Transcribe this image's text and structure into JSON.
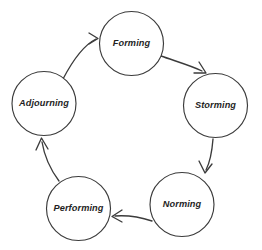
{
  "diagram": {
    "type": "cycle-diagram",
    "title": "",
    "background_color": "#ffffff",
    "stroke_color": "#3b3b3b",
    "label_color": "#1f1f1f",
    "stages": [
      {
        "id": "forming",
        "label": "Forming",
        "cx": 131.5,
        "cy": 43.5,
        "r": 32
      },
      {
        "id": "storming",
        "label": "Storming",
        "cx": 215.5,
        "cy": 105.5,
        "r": 32
      },
      {
        "id": "norming",
        "label": "Norming",
        "cx": 182.0,
        "cy": 204.5,
        "r": 32
      },
      {
        "id": "performing",
        "label": "Performing",
        "cx": 78.5,
        "cy": 208.5,
        "r": 32
      },
      {
        "id": "adjourning",
        "label": "Adjourning",
        "cx": 44.0,
        "cy": 103.5,
        "r": 32
      }
    ],
    "arrows": [
      {
        "id": "adjourning-to-forming",
        "from": "adjourning",
        "to": "forming",
        "path": "M 63 79 C 74 58, 86 44, 96 39",
        "head": "M 89 33 L 98 38.5 L 89 44"
      },
      {
        "id": "forming-to-storming",
        "from": "forming",
        "to": "storming",
        "path": "M 161 56 C 175 61, 192 66, 202 71",
        "head": "M 199 62 L 206 73 L 194 73"
      },
      {
        "id": "storming-to-norming",
        "from": "storming",
        "to": "norming",
        "path": "M 213 139 C 212 152, 210 162, 206 170",
        "head": "M 199 161 L 205 173 L 212 164"
      },
      {
        "id": "norming-to-performing",
        "from": "norming",
        "to": "performing",
        "path": "M 152 221 C 140 217, 128 215, 115 216",
        "head": "M 122 210 L 112 216.5 L 122 222"
      },
      {
        "id": "performing-to-adjourning",
        "from": "performing",
        "to": "adjourning",
        "path": "M 59 181 C 50 169, 44 154, 42 142",
        "head": "M 36 150 L 41.5 138 L 48 149"
      }
    ]
  }
}
